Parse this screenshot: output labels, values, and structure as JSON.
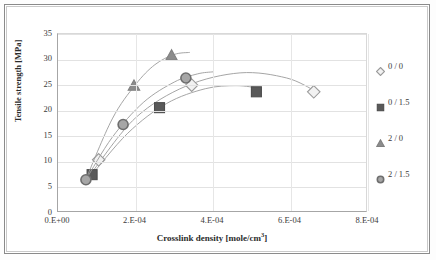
{
  "chart_data": {
    "type": "scatter",
    "title": "",
    "xlabel": "Crosslink density  [mole/cm3]",
    "xlabel_base": "Crosslink density  [mole/cm",
    "xlabel_sup": "3",
    "xlabel_tail": "]",
    "ylabel": "Tensile strength  [MPa]",
    "xlim": [
      0,
      0.0008
    ],
    "ylim": [
      0,
      35
    ],
    "xticks": [
      0,
      0.0002,
      0.0004,
      0.0006,
      0.0008
    ],
    "xtick_labels": [
      "0.E+00",
      "2.E-04",
      "4.E-04",
      "6.E-04",
      "8.E-04"
    ],
    "yticks": [
      0,
      5,
      10,
      15,
      20,
      25,
      30,
      35
    ],
    "ytick_labels": [
      "0",
      "5",
      "10",
      "15",
      "20",
      "25",
      "30",
      "35"
    ],
    "grid": "horizontal-and-vertical",
    "legend_position": "right",
    "series": [
      {
        "name": "0 / 0",
        "marker": "diamond",
        "color": "#9a9a9a",
        "fill": "#f2f2f2",
        "points": [
          {
            "x": 0.000105,
            "y": 10.4
          },
          {
            "x": 0.000345,
            "y": 25.0
          },
          {
            "x": 0.00066,
            "y": 23.7
          }
        ],
        "trend": [
          {
            "x": 9e-05,
            "y": 8.2
          },
          {
            "x": 0.0002,
            "y": 18.6
          },
          {
            "x": 0.00033,
            "y": 24.8
          },
          {
            "x": 0.00047,
            "y": 27.4
          },
          {
            "x": 0.00059,
            "y": 26.4
          },
          {
            "x": 0.000665,
            "y": 23.8
          }
        ]
      },
      {
        "name": "0 / 1.5",
        "marker": "square",
        "color": "#4d4d4d",
        "fill": "#595959",
        "points": [
          {
            "x": 8.8e-05,
            "y": 7.5
          },
          {
            "x": 0.000262,
            "y": 20.6
          },
          {
            "x": 0.000512,
            "y": 23.7
          }
        ],
        "trend": [
          {
            "x": 8e-05,
            "y": 6.8
          },
          {
            "x": 0.00018,
            "y": 15.6
          },
          {
            "x": 0.00028,
            "y": 21.4
          },
          {
            "x": 0.00038,
            "y": 24.3
          },
          {
            "x": 0.00046,
            "y": 24.9
          },
          {
            "x": 0.00052,
            "y": 24.4
          }
        ]
      },
      {
        "name": "2 / 0",
        "marker": "triangle",
        "color": "#808080",
        "fill": "#8c8c8c",
        "points": [
          {
            "x": 0.000196,
            "y": 24.9
          },
          {
            "x": 0.000293,
            "y": 30.8
          }
        ],
        "trend": [
          {
            "x": 7.2e-05,
            "y": 6.6
          },
          {
            "x": 0.00014,
            "y": 18.4
          },
          {
            "x": 0.0002,
            "y": 25.1
          },
          {
            "x": 0.00025,
            "y": 29.0
          },
          {
            "x": 0.0003,
            "y": 31.0
          },
          {
            "x": 0.00034,
            "y": 31.4
          }
        ]
      },
      {
        "name": "2 / 1.5",
        "marker": "circle",
        "color": "#6e6e6e",
        "fill": "#a6a6a6",
        "points": [
          {
            "x": 7.2e-05,
            "y": 6.5
          },
          {
            "x": 0.000168,
            "y": 17.3
          },
          {
            "x": 0.00033,
            "y": 26.4
          }
        ],
        "trend": [
          {
            "x": 7.2e-05,
            "y": 6.5
          },
          {
            "x": 0.00014,
            "y": 14.8
          },
          {
            "x": 0.00022,
            "y": 21.6
          },
          {
            "x": 0.0003,
            "y": 25.6
          },
          {
            "x": 0.00036,
            "y": 27.2
          },
          {
            "x": 0.0004,
            "y": 27.6
          }
        ]
      }
    ]
  },
  "legend": {
    "items": [
      {
        "label": "0 / 0",
        "marker": "diamond"
      },
      {
        "label": "0 / 1.5",
        "marker": "square"
      },
      {
        "label": "2 / 0",
        "marker": "triangle"
      },
      {
        "label": "2 / 1.5",
        "marker": "circle"
      }
    ]
  }
}
